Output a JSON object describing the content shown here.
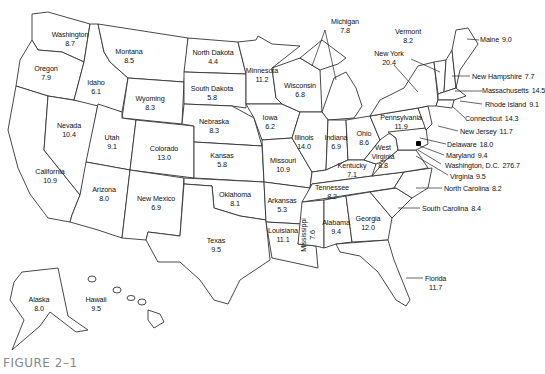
{
  "figure_label": "FIGURE 2–1",
  "states": [
    {
      "name": "Washington",
      "value": "8.7"
    },
    {
      "name": "Oregon",
      "value": "7.9"
    },
    {
      "name": "Idaho",
      "value": "6.1"
    },
    {
      "name": "Montana",
      "value": "8.5"
    },
    {
      "name": "Wyoming",
      "value": "8.3"
    },
    {
      "name": "North Dakota",
      "value": "4.4"
    },
    {
      "name": "South Dakota",
      "value": "5.8"
    },
    {
      "name": "Nebraska",
      "value": "8.3"
    },
    {
      "name": "Minnesota",
      "value": "11.2"
    },
    {
      "name": "Wisconsin",
      "value": "6.8"
    },
    {
      "name": "Michigan",
      "value": "7.8"
    },
    {
      "name": "Iowa",
      "value": "6.2"
    },
    {
      "name": "Illinois",
      "value": "14.0"
    },
    {
      "name": "Indiana",
      "value": "6.9"
    },
    {
      "name": "Ohio",
      "value": "8.6"
    },
    {
      "name": "Nevada",
      "value": "10.4"
    },
    {
      "name": "Utah",
      "value": "9.1"
    },
    {
      "name": "Colorado",
      "value": "13.0"
    },
    {
      "name": "California",
      "value": "10.9"
    },
    {
      "name": "Arizona",
      "value": "8.0"
    },
    {
      "name": "New Mexico",
      "value": "6.9"
    },
    {
      "name": "Kansas",
      "value": "5.8"
    },
    {
      "name": "Missouri",
      "value": "10.9"
    },
    {
      "name": "Oklahoma",
      "value": "8.1"
    },
    {
      "name": "Arkansas",
      "value": "5.3"
    },
    {
      "name": "Texas",
      "value": "9.5"
    },
    {
      "name": "Louisiana",
      "value": "11.1"
    },
    {
      "name": "Mississippi",
      "value": "7.6"
    },
    {
      "name": "Alabama",
      "value": "9.4"
    },
    {
      "name": "Georgia",
      "value": "12.0"
    },
    {
      "name": "Tennessee",
      "value": "8.2"
    },
    {
      "name": "Kentucky",
      "value": "7.1"
    },
    {
      "name": "West Virginia",
      "value": "8.8"
    },
    {
      "name": "Pennsylvania",
      "value": "11.9"
    },
    {
      "name": "New York",
      "value": "20.4"
    },
    {
      "name": "Vermont",
      "value": "8.2"
    },
    {
      "name": "Maine",
      "value": "9.0"
    },
    {
      "name": "New Hampshire",
      "value": "7.7"
    },
    {
      "name": "Massachusetts",
      "value": "14.5"
    },
    {
      "name": "Rhode Island",
      "value": "9.1"
    },
    {
      "name": "Connecticut",
      "value": "14.3"
    },
    {
      "name": "New Jersey",
      "value": "11.7"
    },
    {
      "name": "Delaware",
      "value": "18.0"
    },
    {
      "name": "Maryland",
      "value": "9.4"
    },
    {
      "name": "Washington, D.C.",
      "value": "276.7"
    },
    {
      "name": "Virginia",
      "value": "9.5"
    },
    {
      "name": "North Carolina",
      "value": "8.2"
    },
    {
      "name": "South Carolina",
      "value": "8.4"
    },
    {
      "name": "Florida",
      "value": "11.7"
    },
    {
      "name": "Alaska",
      "value": "8.0"
    },
    {
      "name": "Hawaii",
      "value": "9.5"
    }
  ]
}
